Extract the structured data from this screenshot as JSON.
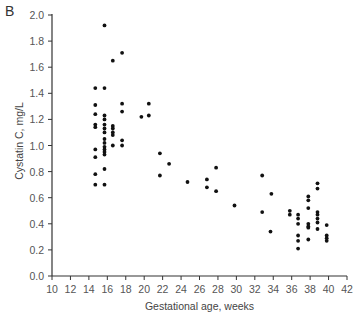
{
  "panel_label": "B",
  "chart_data": {
    "type": "scatter",
    "title": "",
    "xlabel": "Gestational age, weeks",
    "ylabel": "Cystatin C, mg/L",
    "xlim": [
      10,
      42
    ],
    "ylim": [
      0.0,
      2.0
    ],
    "xticks": [
      10,
      12,
      14,
      16,
      18,
      20,
      22,
      24,
      26,
      28,
      30,
      32,
      34,
      36,
      38,
      40,
      42
    ],
    "yticks": [
      "0.0",
      "0.2",
      "0.4",
      "0.6",
      "0.8",
      "1.0",
      "1.2",
      "1.4",
      "1.6",
      "1.8",
      "2.0"
    ],
    "grid": false,
    "legend": null,
    "points": [
      [
        14.7,
        1.44
      ],
      [
        14.7,
        1.31
      ],
      [
        14.7,
        1.24
      ],
      [
        14.7,
        1.16
      ],
      [
        14.7,
        1.14
      ],
      [
        14.7,
        0.97
      ],
      [
        14.7,
        0.91
      ],
      [
        14.7,
        0.78
      ],
      [
        14.7,
        0.7
      ],
      [
        15.7,
        1.92
      ],
      [
        15.7,
        1.44
      ],
      [
        15.7,
        1.23
      ],
      [
        15.7,
        1.2
      ],
      [
        15.7,
        1.16
      ],
      [
        15.7,
        1.13
      ],
      [
        15.7,
        1.1
      ],
      [
        15.7,
        1.05
      ],
      [
        15.7,
        1.02
      ],
      [
        15.7,
        0.99
      ],
      [
        15.7,
        0.97
      ],
      [
        15.7,
        0.95
      ],
      [
        15.7,
        0.93
      ],
      [
        15.7,
        0.82
      ],
      [
        15.7,
        0.7
      ],
      [
        16.6,
        1.65
      ],
      [
        16.6,
        1.15
      ],
      [
        16.6,
        1.13
      ],
      [
        16.6,
        1.1
      ],
      [
        16.6,
        1.08
      ],
      [
        16.6,
        1.0
      ],
      [
        17.6,
        1.71
      ],
      [
        17.6,
        1.32
      ],
      [
        17.6,
        1.26
      ],
      [
        17.6,
        1.04
      ],
      [
        17.6,
        1.0
      ],
      [
        19.7,
        1.22
      ],
      [
        20.5,
        1.32
      ],
      [
        20.5,
        1.23
      ],
      [
        21.7,
        0.94
      ],
      [
        21.7,
        0.77
      ],
      [
        22.7,
        0.86
      ],
      [
        24.7,
        0.72
      ],
      [
        26.8,
        0.74
      ],
      [
        26.8,
        0.68
      ],
      [
        27.8,
        0.83
      ],
      [
        27.8,
        0.65
      ],
      [
        29.8,
        0.54
      ],
      [
        32.8,
        0.77
      ],
      [
        32.8,
        0.49
      ],
      [
        33.8,
        0.63
      ],
      [
        33.7,
        0.34
      ],
      [
        35.8,
        0.5
      ],
      [
        35.8,
        0.47
      ],
      [
        36.7,
        0.47
      ],
      [
        36.7,
        0.44
      ],
      [
        36.7,
        0.4
      ],
      [
        36.7,
        0.31
      ],
      [
        36.7,
        0.27
      ],
      [
        36.7,
        0.21
      ],
      [
        37.8,
        0.61
      ],
      [
        37.8,
        0.58
      ],
      [
        37.8,
        0.52
      ],
      [
        37.8,
        0.4
      ],
      [
        37.8,
        0.38
      ],
      [
        37.8,
        0.37
      ],
      [
        37.8,
        0.28
      ],
      [
        38.8,
        0.71
      ],
      [
        38.8,
        0.67
      ],
      [
        38.8,
        0.49
      ],
      [
        38.8,
        0.47
      ],
      [
        38.8,
        0.44
      ],
      [
        38.8,
        0.41
      ],
      [
        38.8,
        0.36
      ],
      [
        39.8,
        0.39
      ],
      [
        39.8,
        0.31
      ],
      [
        39.8,
        0.29
      ],
      [
        39.8,
        0.27
      ]
    ]
  }
}
